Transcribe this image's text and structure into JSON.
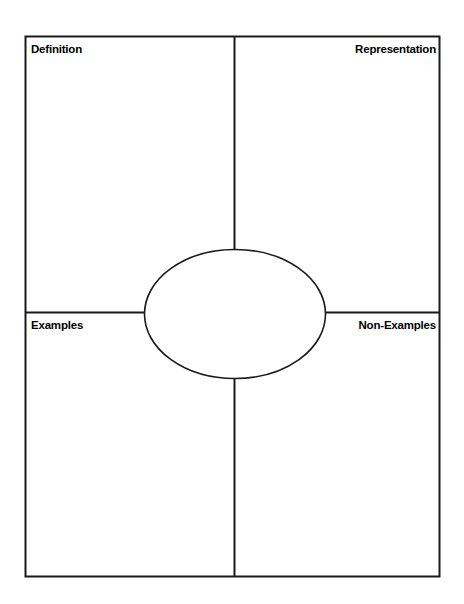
{
  "page": {
    "background_color": "#ffffff",
    "line_color": "#1a1a1a",
    "text_color": "#000000"
  },
  "organizer": {
    "type": "frayer-model",
    "frame": {
      "x": 25,
      "y": 36,
      "width": 415,
      "height": 541
    },
    "vertical_divider_x": 234,
    "horizontal_divider_y": 312,
    "center_ellipse": {
      "cx": 235,
      "cy": 314,
      "rx": 91,
      "ry": 65
    },
    "quadrants": [
      {
        "id": "definition",
        "label": "Definition",
        "position": "top-left",
        "align": "left"
      },
      {
        "id": "representation",
        "label": "Representation",
        "position": "top-right",
        "align": "right"
      },
      {
        "id": "examples",
        "label": "Examples",
        "position": "bottom-left",
        "align": "left"
      },
      {
        "id": "non_examples",
        "label": "Non-Examples",
        "position": "bottom-right",
        "align": "right"
      }
    ],
    "center_label": ""
  }
}
